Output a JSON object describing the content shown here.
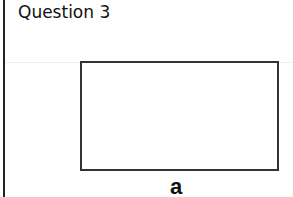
{
  "title": "Question 3",
  "diagram": {
    "shape": "rectangle",
    "side_label": "a"
  }
}
